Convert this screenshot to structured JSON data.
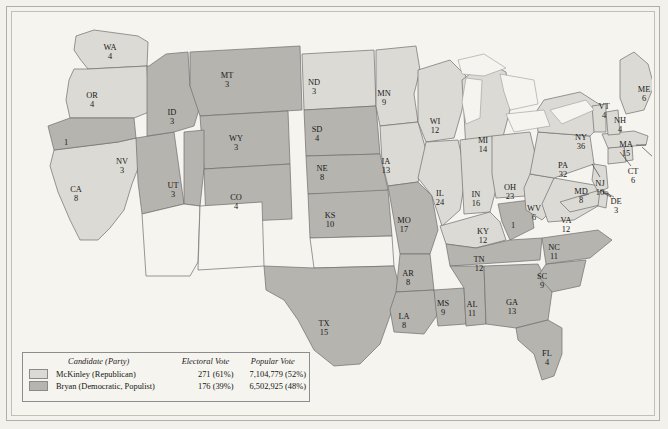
{
  "map": {
    "title": "Election of 1896",
    "colors": {
      "mckinley_fill": "#dcdad5",
      "bryan_fill": "#b6b4af",
      "unorganized_fill": "#f6f4ef",
      "water_fill": "#f6f4ef",
      "border": "#6f6f6f",
      "page_background": "#f3f1ec"
    },
    "states": [
      {
        "code": "WA",
        "label": "WA",
        "votes": "4",
        "party": "mckinley",
        "x": 96,
        "y": 34
      },
      {
        "code": "OR",
        "label": "OR",
        "votes": "4",
        "party": "mckinley",
        "x": 78,
        "y": 82
      },
      {
        "code": "CA",
        "label": "CA",
        "votes": "8",
        "party": "mckinley",
        "x": 62,
        "y": 176
      },
      {
        "code": "CA-split",
        "label": "",
        "votes": "1",
        "party": "bryan",
        "x": 52,
        "y": 129
      },
      {
        "code": "NV",
        "label": "NV",
        "votes": "3",
        "party": "bryan",
        "x": 108,
        "y": 148
      },
      {
        "code": "ID",
        "label": "ID",
        "votes": "3",
        "party": "bryan",
        "x": 158,
        "y": 99
      },
      {
        "code": "MT",
        "label": "MT",
        "votes": "3",
        "party": "bryan",
        "x": 213,
        "y": 62
      },
      {
        "code": "WY",
        "label": "WY",
        "votes": "3",
        "party": "bryan",
        "x": 222,
        "y": 125
      },
      {
        "code": "UT",
        "label": "UT",
        "votes": "3",
        "party": "bryan",
        "x": 159,
        "y": 172
      },
      {
        "code": "CO",
        "label": "CO",
        "votes": "4",
        "party": "bryan",
        "x": 222,
        "y": 184
      },
      {
        "code": "AZ",
        "label": "",
        "votes": "",
        "party": "unorganized",
        "x": 150,
        "y": 250
      },
      {
        "code": "NM",
        "label": "",
        "votes": "",
        "party": "unorganized",
        "x": 215,
        "y": 255
      },
      {
        "code": "ND",
        "label": "ND",
        "votes": "3",
        "party": "mckinley",
        "x": 300,
        "y": 69
      },
      {
        "code": "SD",
        "label": "SD",
        "votes": "4",
        "party": "bryan",
        "x": 303,
        "y": 116
      },
      {
        "code": "NE",
        "label": "NE",
        "votes": "8",
        "party": "bryan",
        "x": 308,
        "y": 155
      },
      {
        "code": "KS",
        "label": "KS",
        "votes": "10",
        "party": "bryan",
        "x": 316,
        "y": 202
      },
      {
        "code": "OK",
        "label": "",
        "votes": "",
        "party": "unorganized",
        "x": 318,
        "y": 252
      },
      {
        "code": "TX",
        "label": "TX",
        "votes": "15",
        "party": "bryan",
        "x": 310,
        "y": 310
      },
      {
        "code": "MN",
        "label": "MN",
        "votes": "9",
        "party": "mckinley",
        "x": 370,
        "y": 80
      },
      {
        "code": "IA",
        "label": "IA",
        "votes": "13",
        "party": "mckinley",
        "x": 372,
        "y": 148
      },
      {
        "code": "MO",
        "label": "MO",
        "votes": "17",
        "party": "bryan",
        "x": 390,
        "y": 207
      },
      {
        "code": "AR",
        "label": "AR",
        "votes": "8",
        "party": "bryan",
        "x": 394,
        "y": 260
      },
      {
        "code": "LA",
        "label": "LA",
        "votes": "8",
        "party": "bryan",
        "x": 390,
        "y": 303
      },
      {
        "code": "WI",
        "label": "WI",
        "votes": "12",
        "party": "mckinley",
        "x": 421,
        "y": 108
      },
      {
        "code": "IL",
        "label": "IL",
        "votes": "24",
        "party": "mckinley",
        "x": 426,
        "y": 180
      },
      {
        "code": "MS",
        "label": "MS",
        "votes": "9",
        "party": "bryan",
        "x": 429,
        "y": 290
      },
      {
        "code": "MI",
        "label": "MI",
        "votes": "14",
        "party": "mckinley",
        "x": 469,
        "y": 127
      },
      {
        "code": "IN",
        "label": "IN",
        "votes": "16",
        "party": "mckinley",
        "x": 462,
        "y": 181
      },
      {
        "code": "KY",
        "label": "KY",
        "votes": "12",
        "party": "mckinley",
        "x": 469,
        "y": 218
      },
      {
        "code": "KY-split",
        "label": "",
        "votes": "1",
        "party": "bryan",
        "x": 499,
        "y": 212
      },
      {
        "code": "TN",
        "label": "TN",
        "votes": "12",
        "party": "bryan",
        "x": 465,
        "y": 246
      },
      {
        "code": "AL",
        "label": "AL",
        "votes": "11",
        "party": "bryan",
        "x": 458,
        "y": 291
      },
      {
        "code": "GA",
        "label": "GA",
        "votes": "13",
        "party": "bryan",
        "x": 498,
        "y": 289
      },
      {
        "code": "OH",
        "label": "OH",
        "votes": "23",
        "party": "mckinley",
        "x": 496,
        "y": 174
      },
      {
        "code": "WV",
        "label": "WV",
        "votes": "6",
        "party": "mckinley",
        "x": 520,
        "y": 195
      },
      {
        "code": "FL",
        "label": "FL",
        "votes": "4",
        "party": "bryan",
        "x": 533,
        "y": 340
      },
      {
        "code": "SC",
        "label": "SC",
        "votes": "9",
        "party": "bryan",
        "x": 528,
        "y": 263
      },
      {
        "code": "NC",
        "label": "NC",
        "votes": "11",
        "party": "bryan",
        "x": 540,
        "y": 234
      },
      {
        "code": "VA",
        "label": "VA",
        "votes": "12",
        "party": "mckinley",
        "x": 552,
        "y": 207
      },
      {
        "code": "PA",
        "label": "PA",
        "votes": "32",
        "party": "mckinley",
        "x": 549,
        "y": 152
      },
      {
        "code": "NY",
        "label": "NY",
        "votes": "36",
        "party": "mckinley",
        "x": 567,
        "y": 124
      },
      {
        "code": "MD",
        "label": "MD",
        "votes": "8",
        "party": "mckinley",
        "x": 567,
        "y": 178
      },
      {
        "code": "DE",
        "label": "DE",
        "votes": "3",
        "party": "mckinley",
        "x": 602,
        "y": 188
      },
      {
        "code": "NJ",
        "label": "NJ",
        "votes": "10",
        "party": "mckinley",
        "x": 586,
        "y": 170
      },
      {
        "code": "CT",
        "label": "CT",
        "votes": "6",
        "party": "mckinley",
        "x": 619,
        "y": 158
      },
      {
        "code": "RI",
        "label": "RI",
        "votes": "4",
        "party": "mckinley",
        "x": 643,
        "y": 150
      },
      {
        "code": "MA",
        "label": "MA",
        "votes": "15",
        "party": "mckinley",
        "x": 612,
        "y": 131
      },
      {
        "code": "NH",
        "label": "NH",
        "votes": "4",
        "party": "mckinley",
        "x": 606,
        "y": 107
      },
      {
        "code": "VT",
        "label": "VT",
        "votes": "4",
        "party": "mckinley",
        "x": 590,
        "y": 93
      },
      {
        "code": "ME",
        "label": "ME",
        "votes": "6",
        "party": "mckinley",
        "x": 630,
        "y": 76
      }
    ]
  },
  "legend": {
    "headers": {
      "candidate": "Candidate (Party)",
      "electoral": "Electoral Vote",
      "popular": "Popular Vote"
    },
    "rows": [
      {
        "name": "McKinley (Republican)",
        "electoral": "271 (61%)",
        "popular": "7,104,779 (52%)",
        "swatch": "#dcdad5"
      },
      {
        "name": "Bryan (Democratic, Populist)",
        "electoral": "176 (39%)",
        "popular": "6,502,925 (48%)",
        "swatch": "#b6b4af"
      }
    ]
  }
}
